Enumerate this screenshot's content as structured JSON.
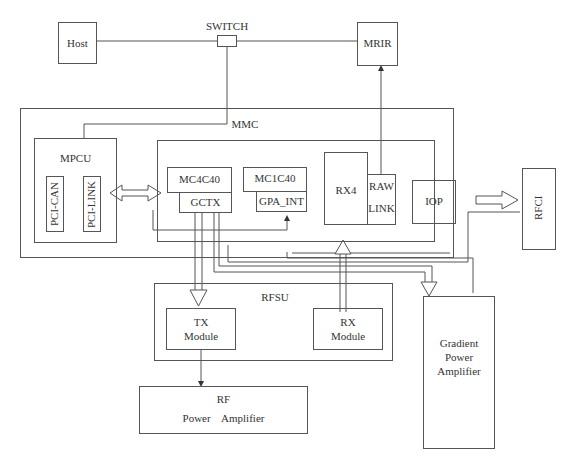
{
  "diagram": {
    "type": "block-diagram",
    "nodes": {
      "host": "Host",
      "switch": "SWITCH",
      "mrir": "MRIR",
      "mmc": "MMC",
      "mpcu": "MPCU",
      "pci_can": "PCI-CAN",
      "pci_link": "PCI-LINK",
      "mc4c40": "MC4C40",
      "gctx": "GCTX",
      "mc1c40": "MC1C40",
      "gpa_int": "GPA_INT",
      "rx4": "RX4",
      "raw_link_1": "RAW",
      "raw_link_2": "LINK",
      "iop": "IOP",
      "rfci": "RFCI",
      "rfsu": "RFSU",
      "tx_module_1": "TX",
      "tx_module_2": "Module",
      "rx_module_1": "RX",
      "rx_module_2": "Module",
      "rf_pa_1": "RF",
      "rf_pa_2": "Power    Amplifier",
      "gpa_1": "Gradient",
      "gpa_2": "Power",
      "gpa_3": "Amplifier"
    },
    "edges": [
      {
        "from": "Host",
        "to": "SWITCH",
        "type": "line"
      },
      {
        "from": "SWITCH",
        "to": "MRIR",
        "type": "line"
      },
      {
        "from": "SWITCH",
        "to": "MPCU",
        "type": "line"
      },
      {
        "from": "RAW LINK",
        "to": "MRIR",
        "type": "arrow"
      },
      {
        "from": "PCI-LINK",
        "to": "MC4C40",
        "type": "double-block-arrow"
      },
      {
        "from": "MMC",
        "to": "RFCI",
        "type": "block-arrow"
      },
      {
        "from": "GCTX",
        "to": "TX Module",
        "type": "block-arrow"
      },
      {
        "from": "RX Module",
        "to": "RX4",
        "type": "block-arrow"
      },
      {
        "from": "GCTX",
        "to": "Gradient Power Amplifier",
        "type": "block-arrow"
      },
      {
        "from": "MMC",
        "to": "Gradient Power Amplifier",
        "type": "arrow"
      },
      {
        "from": "MMC",
        "to": "GPA_INT",
        "type": "arrow"
      },
      {
        "from": "TX Module",
        "to": "RF Power Amplifier",
        "type": "arrow"
      }
    ],
    "colors": {
      "line": "#555555",
      "text": "#333333",
      "background": "#ffffff"
    }
  }
}
